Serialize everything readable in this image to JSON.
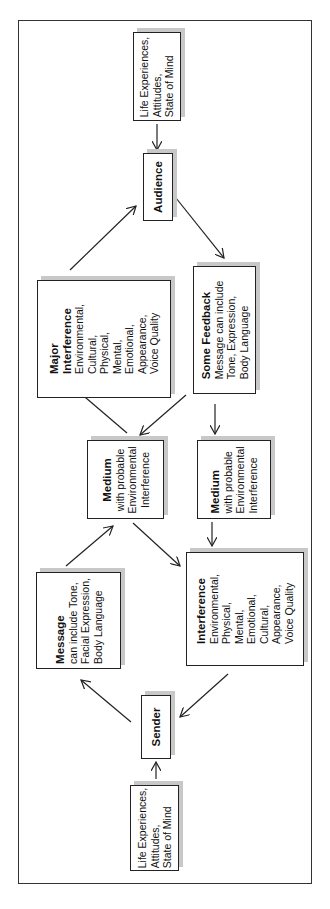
{
  "diagram": {
    "orientation": "rotated 90 degrees counterclockwise",
    "nodes": {
      "audience_context": {
        "lines": [
          "Life Experiences,",
          "Attitudes,",
          "State of Mind"
        ]
      },
      "audience": {
        "title": "Audience"
      },
      "major_interference": {
        "title": [
          "Major",
          "Interference"
        ],
        "lines": [
          "Environmental,",
          "Cultural,",
          "Physical,",
          "Mental,",
          "Emotional,",
          "Appearance,",
          "Voice Quality"
        ]
      },
      "some_feedback": {
        "title": "Some Feedback",
        "lines": [
          "Message can include",
          "Tone, Expression,",
          "Body Language"
        ]
      },
      "medium_left": {
        "title": "Medium",
        "lines": [
          "with probable",
          "Environmental",
          "Interference"
        ]
      },
      "medium_right": {
        "title": "Medium",
        "lines": [
          "with probable",
          "Environmental",
          "Interference"
        ]
      },
      "message": {
        "title": "Message",
        "lines": [
          "can include Tone,",
          "Facial Expression,",
          "Body Language"
        ]
      },
      "interference": {
        "title": "Interference",
        "lines": [
          "Environmental,",
          "Physical,",
          "Mental,",
          "Emotional,",
          "Cultural,",
          "Appearance,",
          "Voice Quality"
        ]
      },
      "sender": {
        "title": "Sender"
      },
      "sender_context": {
        "lines": [
          "Life Experiences,",
          "Attitudes,",
          "State of Mind"
        ]
      }
    },
    "edges": [
      {
        "from": "sender_context",
        "to": "sender"
      },
      {
        "from": "sender",
        "to": "message"
      },
      {
        "from": "message",
        "to": "medium_left"
      },
      {
        "from": "medium_left",
        "to": "major_interference"
      },
      {
        "from": "major_interference",
        "to": "audience"
      },
      {
        "from": "audience_context",
        "to": "audience"
      },
      {
        "from": "audience",
        "to": "some_feedback"
      },
      {
        "from": "some_feedback",
        "to": "medium_left"
      },
      {
        "from": "some_feedback",
        "to": "medium_right"
      },
      {
        "from": "medium_right",
        "to": "interference"
      },
      {
        "from": "medium_left",
        "to": "interference"
      },
      {
        "from": "interference",
        "to": "sender"
      }
    ]
  }
}
